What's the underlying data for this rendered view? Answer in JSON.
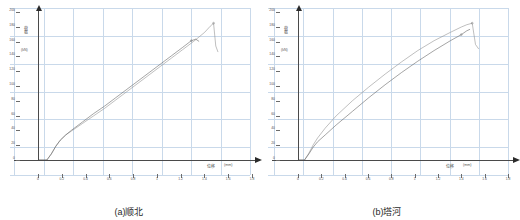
{
  "figure": {
    "panels": [
      {
        "id": "panel-a",
        "caption": "(a)顺北",
        "x_axis": {
          "title": "位移",
          "unit": "(mm)",
          "ticks": [
            "0",
            "0.2",
            "0.4",
            "0.6",
            "0.8",
            "1",
            "1.2",
            "1.4",
            "1.6",
            "1.8"
          ]
        },
        "y_axis": {
          "title": "荷载",
          "unit": "(kN)",
          "ticks": [
            "0",
            "20",
            "40",
            "60",
            "80",
            "100",
            "120",
            "140",
            "160",
            "180",
            "200"
          ]
        }
      },
      {
        "id": "panel-b",
        "caption": "(b)塔河",
        "x_axis": {
          "title": "位移",
          "unit": "(mm)",
          "ticks": [
            "0",
            "0.2",
            "0.4",
            "0.6",
            "0.8",
            "1",
            "1.2",
            "1.4",
            "1.6",
            "1.8"
          ]
        },
        "y_axis": {
          "title": "荷载",
          "unit": "(kN)",
          "ticks": [
            "0",
            "20",
            "40",
            "60",
            "80",
            "100",
            "120",
            "140",
            "160",
            "180",
            "200"
          ]
        }
      }
    ]
  },
  "chart_data": [
    {
      "type": "line",
      "title": "(a)顺北",
      "xlabel": "位移 (mm)",
      "ylabel": "荷载 (kN)",
      "xlim": [
        0,
        1.8
      ],
      "ylim": [
        0,
        200
      ],
      "grid": true,
      "legend": "none",
      "series": [
        {
          "name": "试件1",
          "x": [
            0,
            0.08,
            0.12,
            0.16,
            0.2,
            0.25,
            0.3,
            0.4,
            0.5,
            0.6,
            0.7,
            0.8,
            0.9,
            1.0,
            1.1,
            1.2,
            1.3,
            1.4,
            1.45,
            1.5,
            1.55,
            1.58,
            1.6,
            1.62
          ],
          "y": [
            0,
            0,
            8,
            18,
            26,
            33,
            38,
            48,
            58,
            68,
            79,
            90,
            101,
            112,
            123,
            134,
            145,
            156,
            162,
            168,
            176,
            180,
            150,
            142
          ]
        },
        {
          "name": "试件2",
          "x": [
            0,
            0.08,
            0.12,
            0.16,
            0.2,
            0.25,
            0.3,
            0.4,
            0.5,
            0.6,
            0.7,
            0.8,
            0.9,
            1.0,
            1.1,
            1.2,
            1.3,
            1.38,
            1.42,
            1.45
          ],
          "y": [
            0,
            0,
            8,
            18,
            26,
            33,
            39,
            50,
            61,
            71,
            82,
            93,
            104,
            115,
            126,
            137,
            148,
            157,
            159,
            156
          ]
        }
      ]
    },
    {
      "type": "line",
      "title": "(b)塔河",
      "xlabel": "位移 (mm)",
      "ylabel": "荷载 (kN)",
      "xlim": [
        0,
        1.8
      ],
      "ylim": [
        0,
        200
      ],
      "grid": true,
      "legend": "none",
      "series": [
        {
          "name": "试件1",
          "x": [
            0,
            0.06,
            0.1,
            0.14,
            0.18,
            0.25,
            0.35,
            0.5,
            0.65,
            0.8,
            0.95,
            1.1,
            1.25,
            1.4,
            1.5,
            1.55,
            1.6,
            1.63,
            1.66
          ],
          "y": [
            0,
            0,
            9,
            20,
            29,
            42,
            58,
            78,
            96,
            113,
            129,
            144,
            157,
            168,
            175,
            178,
            180,
            152,
            146
          ]
        },
        {
          "name": "试件2",
          "x": [
            0,
            0.06,
            0.1,
            0.14,
            0.18,
            0.25,
            0.35,
            0.5,
            0.65,
            0.8,
            0.95,
            1.1,
            1.25,
            1.4,
            1.5,
            1.55,
            1.58
          ],
          "y": [
            0,
            0,
            8,
            17,
            24,
            33,
            46,
            64,
            82,
            99,
            115,
            130,
            144,
            157,
            165,
            170,
            172
          ]
        }
      ]
    }
  ]
}
